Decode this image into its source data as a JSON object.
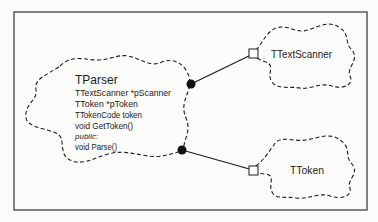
{
  "diagram": {
    "classes": [
      {
        "name": "TParser",
        "members": [
          "TTextScanner *pScanner",
          "TToken *pToken",
          "TTokenCode token",
          "void GetToken()"
        ],
        "visibility_label": "public:",
        "public_members": [
          "void Parse()"
        ]
      },
      {
        "name": "TTextScanner"
      },
      {
        "name": "TToken"
      }
    ],
    "relationships": [
      {
        "from": "TParser",
        "to": "TTextScanner",
        "type": "has"
      },
      {
        "from": "TParser",
        "to": "TToken",
        "type": "has"
      }
    ]
  },
  "colors": {
    "stroke": "#1c1c1c",
    "background": "#fbfbfa"
  }
}
